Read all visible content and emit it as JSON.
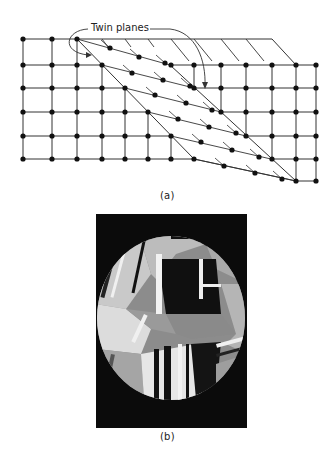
{
  "figure_a": {
    "label": "Twin planes",
    "caption": "(a)",
    "lattice": {
      "columns_x": [
        23,
        52,
        77,
        102,
        125,
        148,
        171,
        194,
        221,
        246,
        272,
        296,
        316
      ],
      "rows_y": [
        39,
        65,
        88,
        112,
        136,
        159
      ],
      "right_region_extra_row_y": 181,
      "left_twin_plane": [
        [
          77,
          39
        ],
        [
          102,
          65
        ],
        [
          125,
          88
        ],
        [
          148,
          112
        ],
        [
          171,
          136
        ],
        [
          194,
          159
        ]
      ],
      "right_twin_plane": [
        [
          170,
          65
        ],
        [
          194,
          88
        ],
        [
          221,
          112
        ],
        [
          246,
          136
        ],
        [
          271,
          159
        ],
        [
          296,
          181
        ]
      ],
      "displaced_atoms": [
        [
          110,
          48
        ],
        [
          139,
          57
        ],
        [
          165,
          63
        ],
        [
          132,
          73
        ],
        [
          163,
          80
        ],
        [
          190,
          86
        ],
        [
          155,
          95
        ],
        [
          186,
          103
        ],
        [
          212,
          110
        ],
        [
          178,
          119
        ],
        [
          209,
          127
        ],
        [
          236,
          133
        ],
        [
          201,
          142
        ],
        [
          232,
          150
        ],
        [
          259,
          157
        ],
        [
          224,
          166
        ],
        [
          255,
          173
        ],
        [
          282,
          179
        ]
      ]
    },
    "colors": {
      "line": "#333333",
      "atom": "#111111"
    }
  },
  "figure_b": {
    "caption": "(b)",
    "description": "Optical micrograph of polycrystalline metal showing annealing twin bands within grains"
  }
}
